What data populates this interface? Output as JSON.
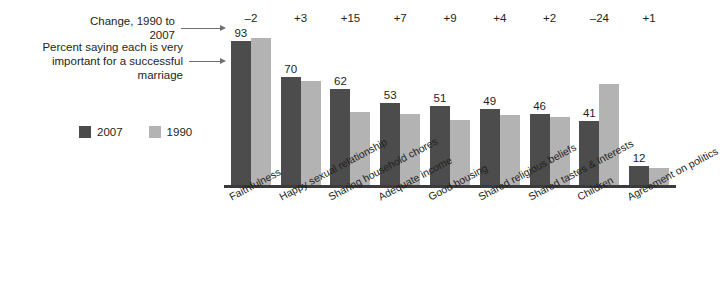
{
  "annotations": {
    "change_label": "Change, 1990 to 2007",
    "percent_label": "Percent saying each is very\nimportant for a successful marriage",
    "arrow_icon": "arrow-right-icon"
  },
  "legend": {
    "items": [
      {
        "label": "2007",
        "color": "#4c4c4c",
        "swatch_icon": "legend-swatch-2007"
      },
      {
        "label": "1990",
        "color": "#b3b3b3",
        "swatch_icon": "legend-swatch-1990"
      }
    ]
  },
  "colors": {
    "series_2007": "#4c4c4c",
    "series_1990": "#b3b3b3",
    "axis": "#3b3b3b",
    "text": "#231f20",
    "leader": "#6f6f6f"
  },
  "chart_data": {
    "type": "bar",
    "title": "",
    "subtitle": "",
    "xlabel": "",
    "ylabel": "",
    "ylim": [
      0,
      100
    ],
    "grid": false,
    "legend_position": "left",
    "categories": [
      "Faithfulness",
      "Happy sexual relationship",
      "Sharing household chores",
      "Adequate income",
      "Good housing",
      "Shared religious beliefs",
      "Shared tastes & interests",
      "Children",
      "Agreement on politics"
    ],
    "series": [
      {
        "name": "2007",
        "color": "#4c4c4c",
        "values": [
          93,
          70,
          62,
          53,
          51,
          49,
          46,
          41,
          12
        ]
      },
      {
        "name": "1990",
        "color": "#b3b3b3",
        "values": [
          95,
          67,
          47,
          46,
          42,
          45,
          44,
          65,
          11
        ]
      }
    ],
    "value_labels": [
      "93",
      "70",
      "62",
      "53",
      "51",
      "49",
      "46",
      "41",
      "12"
    ],
    "change_1990_to_2007": [
      "–2",
      "+3",
      "+15",
      "+7",
      "+9",
      "+4",
      "+2",
      "–24",
      "+1"
    ]
  }
}
